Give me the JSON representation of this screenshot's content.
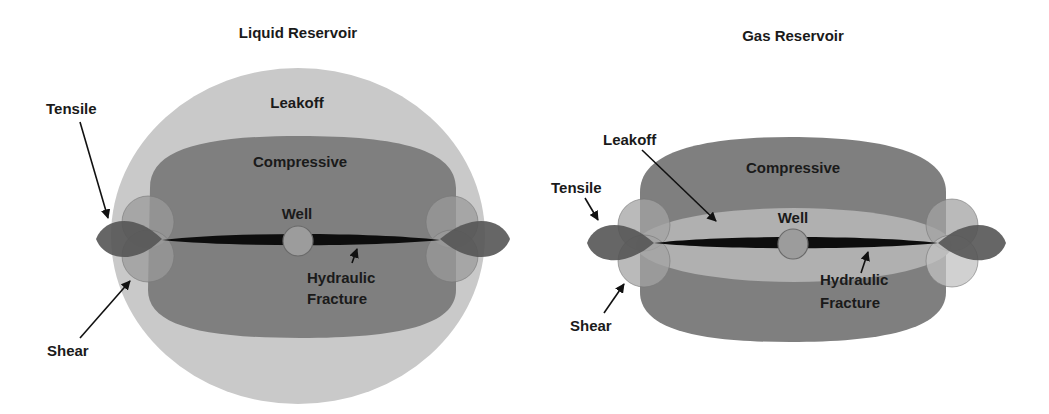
{
  "figure": {
    "panels": [
      {
        "id": "liquid",
        "title": "Liquid Reservoir",
        "labels": {
          "leakoff": "Leakoff",
          "compressive": "Compressive",
          "well": "Well",
          "fracture_line1": "Hydraulic",
          "fracture_line2": "Fracture",
          "tensile": "Tensile",
          "shear": "Shear"
        }
      },
      {
        "id": "gas",
        "title": "Gas Reservoir",
        "labels": {
          "leakoff": "Leakoff",
          "compressive": "Compressive",
          "well": "Well",
          "fracture_line1": "Hydraulic",
          "fracture_line2": "Fracture",
          "tensile": "Tensile",
          "shear": "Shear"
        }
      }
    ],
    "colors": {
      "background": "#ffffff",
      "leakoff": "#c9c9c9",
      "compressive": "#7f7f7f",
      "tensile": "#555555",
      "shear": "#9a9a9a",
      "fracture": "#0d0d0d",
      "well": "#9c9c9c",
      "text": "#1a1a1a"
    }
  }
}
